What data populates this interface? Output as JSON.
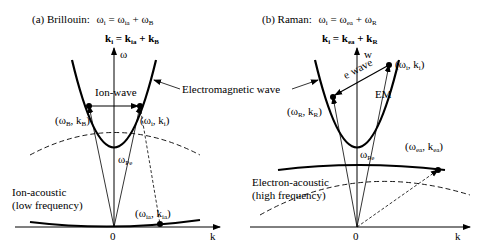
{
  "figure": {
    "panel_a": {
      "title_prefix": "(a) Brillouin:",
      "eq_omega": "ω",
      "eq_omega_sub": "i",
      "eq_omega_rhs_1": " = ω",
      "eq_omega_rhs_1_sub": "ia",
      "eq_omega_rhs_2": " + ω",
      "eq_omega_rhs_2_sub": "B",
      "eq_k": "k",
      "eq_k_sub": "i",
      "eq_k_rhs_1": " = k",
      "eq_k_rhs_1_sub": "ia",
      "eq_k_rhs_2": " + k",
      "eq_k_rhs_2_sub": "B",
      "axis_y": "ω",
      "axis_x": "k",
      "origin": "0",
      "label_ion_wave": "Ion-wave",
      "label_scattered": "(ω",
      "label_scattered_sub": "B",
      "label_scattered_mid": ", k",
      "label_scattered_sub2": "B",
      "label_scattered_end": ")",
      "label_incident": "(ω",
      "label_incident_sub": "i",
      "label_incident_mid": ", k",
      "label_incident_sub2": "i",
      "label_incident_end": ")",
      "label_wpe": "ω",
      "label_wpe_sub": "Pe",
      "label_ion_acoustic_1": "Ion-acoustic",
      "label_ion_acoustic_2": "(low frequency)",
      "label_ia_point": "(ω",
      "label_ia_point_sub": "ia",
      "label_ia_point_mid": ", k",
      "label_ia_point_sub2": "ia",
      "label_ia_point_end": ")"
    },
    "center_label": "Electromagnetic wave",
    "panel_b": {
      "title_prefix": "(b) Raman:",
      "eq_omega": "ω",
      "eq_omega_sub": "i",
      "eq_omega_rhs_1": " = ω",
      "eq_omega_rhs_1_sub": "ea",
      "eq_omega_rhs_2": " + ω",
      "eq_omega_rhs_2_sub": "R",
      "eq_k": "k",
      "eq_k_sub": "i",
      "eq_k_rhs_1": " = k",
      "eq_k_rhs_1_sub": "ea",
      "eq_k_rhs_2": " + k",
      "eq_k_rhs_2_sub": "R",
      "axis_y": "w",
      "axis_x": "k",
      "origin": "0",
      "label_wave": "wave",
      "label_e": "e",
      "label_em": "EM",
      "label_incident": "(ω",
      "label_incident_sub": "i",
      "label_incident_mid": ", k",
      "label_incident_sub2": "i",
      "label_incident_end": ")",
      "label_scattered": "(ω",
      "label_scattered_sub": "R",
      "label_scattered_mid": ", k",
      "label_scattered_sub2": "R",
      "label_scattered_end": ")",
      "label_wpe": "ω",
      "label_wpe_sub": "Pe",
      "label_ea_point": "(ω",
      "label_ea_point_sub": "ea",
      "label_ea_point_mid": ", k",
      "label_ea_point_sub2": "ea",
      "label_ea_point_end": ")",
      "label_electron_acoustic_1": "Electron-acoustic",
      "label_electron_acoustic_2": "(high frequency)"
    }
  }
}
